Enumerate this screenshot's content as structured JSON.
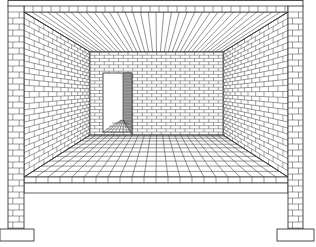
{
  "figure": {
    "width": 316,
    "height": 247,
    "colors": {
      "background": "#ffffff",
      "line": "#3a3a3a",
      "reveal": "#9a9a9a"
    },
    "vanishing_point": [
      156,
      92
    ],
    "top_beam": {
      "x1": 8,
      "x2": 303,
      "y1": 0,
      "y2": 6
    },
    "brick_band": {
      "x1": 24,
      "x2": 288,
      "y1": 6,
      "y2": 12
    },
    "room_front": {
      "x1": 24,
      "x2": 288,
      "y_top": 12,
      "y_floor": 177
    },
    "back_wall": {
      "x1": 90,
      "x2": 223,
      "y1": 52,
      "y2": 135
    },
    "door": {
      "x1": 103,
      "x2": 123,
      "reveal_x2": 132,
      "y_top": 73,
      "y_bottom": 132
    },
    "floor_slab": {
      "x1": 24,
      "x2": 288,
      "front_tile_y2": 183,
      "y2": 193
    },
    "pillars": [
      {
        "name": "left",
        "x1": 8,
        "x2": 24,
        "y1": 6,
        "y2": 229
      },
      {
        "name": "right",
        "x1": 288,
        "x2": 303,
        "y1": 6,
        "y2": 229
      }
    ],
    "footings": [
      {
        "name": "left",
        "x1": 0,
        "x2": 34,
        "y1": 229,
        "y2": 241
      },
      {
        "name": "right",
        "x1": 277,
        "x2": 314,
        "y1": 229,
        "y2": 241
      }
    ]
  }
}
